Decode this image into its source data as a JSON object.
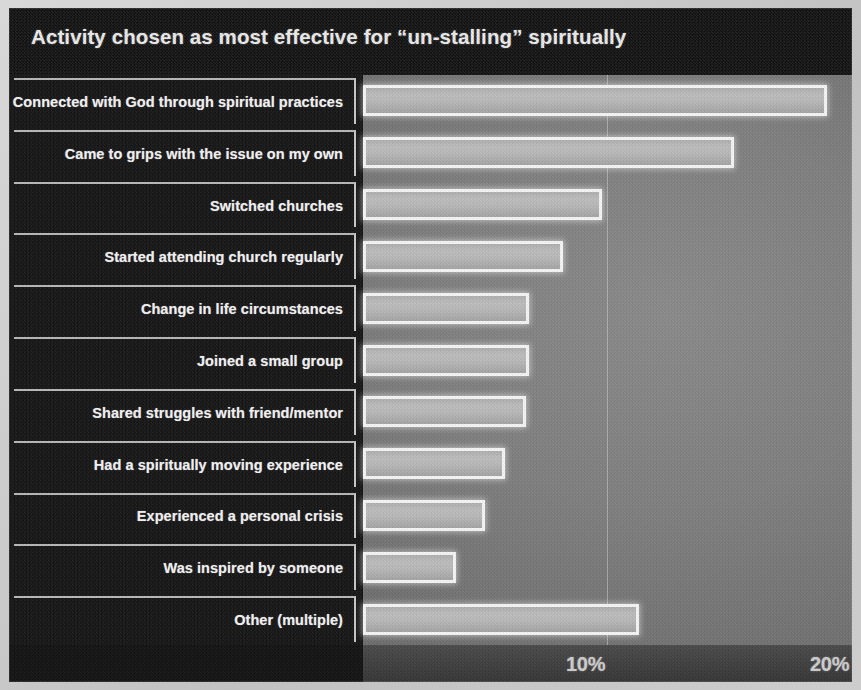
{
  "chart_data": {
    "type": "bar",
    "orientation": "horizontal",
    "title": "Activity chosen as most effective for “un-stalling” spiritually",
    "xlabel": "",
    "ylabel": "",
    "xlim": [
      0,
      20
    ],
    "xticks": [
      10,
      20
    ],
    "xtick_labels": [
      "10%",
      "20%"
    ],
    "grid": "vertical-only",
    "legend": "none",
    "value_unit": "%",
    "categories": [
      "Connected with God through spiritual practices",
      "Came to grips with the issue on my own",
      "Switched churches",
      "Started attending church regularly",
      "Change in life circumstances",
      "Joined a small group",
      "Shared struggles with friend/mentor",
      "Had a spiritually moving experience",
      "Experienced a personal crisis",
      "Was inspired by someone",
      "Other (multiple)"
    ],
    "values": [
      19.0,
      15.2,
      9.8,
      8.2,
      6.8,
      6.8,
      6.7,
      5.8,
      5.0,
      3.8,
      11.3
    ]
  },
  "colors": {
    "plate_background": "#141414",
    "plot_background": "#7f7f7f",
    "bar_outline": "#fdfdfd",
    "bar_fill": "#bdbdbd",
    "text": "#f2f2f2",
    "gridline": "#e1e1e1",
    "axis_band": "#3e3e3e"
  }
}
